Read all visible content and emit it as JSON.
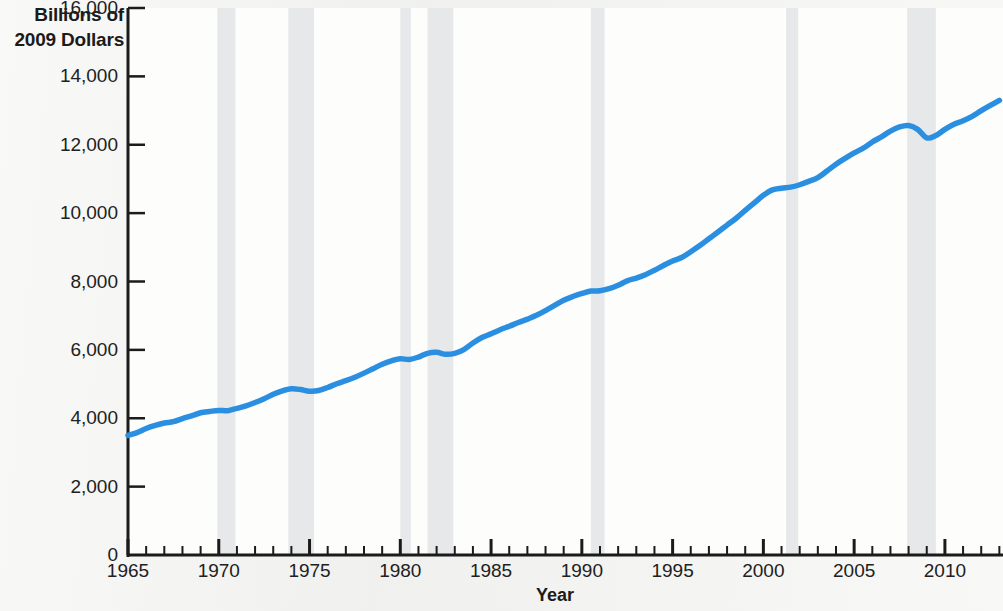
{
  "chart_data": {
    "type": "line",
    "title": "",
    "xlabel": "Year",
    "ylabel": "Billions of 2009 Dollars",
    "ylabel_line1": "Billions of",
    "ylabel_line2": "2009 Dollars",
    "series_label": "Real GDP",
    "grid": false,
    "legend_position": "inline-annotation",
    "xlim": [
      1965,
      2013.2
    ],
    "ylim": [
      0,
      16000
    ],
    "ytick_labels": [
      "0",
      "2,000",
      "4,000",
      "6,000",
      "8,000",
      "10,000",
      "12,000",
      "14,000",
      "16,000"
    ],
    "ytick_values": [
      0,
      2000,
      4000,
      6000,
      8000,
      10000,
      12000,
      14000,
      16000
    ],
    "xtick_labels": [
      "1965",
      "1970",
      "1975",
      "1980",
      "1985",
      "1990",
      "1995",
      "2000",
      "2005",
      "2010"
    ],
    "xtick_values": [
      1965,
      1970,
      1975,
      1980,
      1985,
      1990,
      1995,
      2000,
      2005,
      2010
    ],
    "x_minor_step": 1,
    "line_color": "#2a8fe0",
    "recession_band_color": "#e6e8ea",
    "axis_color": "#1b1b1b",
    "recession_bands": [
      {
        "start": 1969.92,
        "end": 1970.92
      },
      {
        "start": 1973.83,
        "end": 1975.25
      },
      {
        "start": 1980.0,
        "end": 1980.58
      },
      {
        "start": 1981.5,
        "end": 1982.92
      },
      {
        "start": 1990.5,
        "end": 1991.25
      },
      {
        "start": 2001.25,
        "end": 2001.92
      },
      {
        "start": 2007.92,
        "end": 2009.5
      }
    ],
    "series": [
      {
        "name": "Real GDP",
        "x": [
          1965,
          1965.5,
          1966,
          1966.5,
          1967,
          1967.5,
          1968,
          1968.5,
          1969,
          1969.5,
          1970,
          1970.5,
          1971,
          1971.5,
          1972,
          1972.5,
          1973,
          1973.5,
          1974,
          1974.5,
          1975,
          1975.5,
          1976,
          1976.5,
          1977,
          1977.5,
          1978,
          1978.5,
          1979,
          1979.5,
          1980,
          1980.5,
          1981,
          1981.5,
          1982,
          1982.5,
          1983,
          1983.5,
          1984,
          1984.5,
          1985,
          1985.5,
          1986,
          1986.5,
          1987,
          1987.5,
          1988,
          1988.5,
          1989,
          1989.5,
          1990,
          1990.5,
          1991,
          1991.5,
          1992,
          1992.5,
          1993,
          1993.5,
          1994,
          1994.5,
          1995,
          1995.5,
          1996,
          1996.5,
          1997,
          1997.5,
          1998,
          1998.5,
          1999,
          1999.5,
          2000,
          2000.5,
          2001,
          2001.5,
          2002,
          2002.5,
          2003,
          2003.5,
          2004,
          2004.5,
          2005,
          2005.5,
          2006,
          2006.5,
          2007,
          2007.5,
          2008,
          2008.5,
          2009,
          2009.5,
          2010,
          2010.5,
          2011,
          2011.5,
          2012,
          2012.5,
          2013
        ],
        "values": [
          3500,
          3580,
          3700,
          3790,
          3860,
          3900,
          3990,
          4070,
          4160,
          4200,
          4230,
          4220,
          4290,
          4360,
          4460,
          4570,
          4700,
          4800,
          4860,
          4840,
          4790,
          4810,
          4900,
          5010,
          5100,
          5200,
          5320,
          5450,
          5580,
          5680,
          5740,
          5720,
          5790,
          5900,
          5930,
          5870,
          5900,
          6010,
          6200,
          6360,
          6470,
          6590,
          6690,
          6800,
          6900,
          7010,
          7150,
          7300,
          7450,
          7560,
          7650,
          7720,
          7730,
          7790,
          7890,
          8020,
          8100,
          8200,
          8330,
          8470,
          8600,
          8700,
          8870,
          9050,
          9250,
          9450,
          9650,
          9850,
          10080,
          10300,
          10520,
          10680,
          10730,
          10760,
          10830,
          10930,
          11040,
          11230,
          11430,
          11600,
          11760,
          11900,
          12080,
          12230,
          12400,
          12520,
          12560,
          12450,
          12200,
          12270,
          12450,
          12600,
          12700,
          12830,
          13000,
          13150,
          13300
        ]
      }
    ],
    "series_display": {
      "note": "Real GDP, billions of chained 2009 dollars, quarterly, shaded bands mark NBER recessions"
    }
  }
}
